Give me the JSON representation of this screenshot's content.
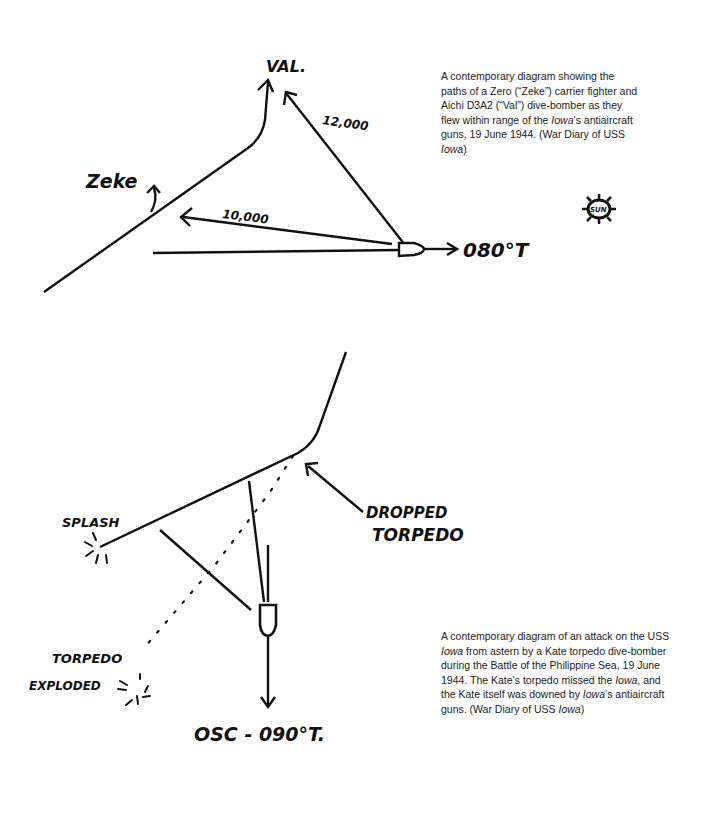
{
  "figure1": {
    "labels": {
      "val": "VAL.",
      "zeke": "Zeke",
      "range_val": "12,000",
      "range_zeke": "10,000",
      "heading": "080°T",
      "sun": "SUN"
    },
    "caption": {
      "p1": "A contemporary diagram showing the paths of a Zero (“Zeke”) carrier fighter and Aichi D3A2 (“Val”) dive-bomber as they flew within range of the ",
      "ship1": "Iowa",
      "p2": "’s antiaircraft guns, 19 June 1944. (War Diary of USS ",
      "ship2": "Iowa",
      "p3": ")"
    }
  },
  "figure2": {
    "labels": {
      "splash": "SPLASH",
      "dropped": "DROPPED",
      "torpedo": "TORPEDO",
      "torpedo_exploded_1": "TORPEDO",
      "torpedo_exploded_2": "EXPLODED",
      "heading": "OSC - 090°T."
    },
    "caption": {
      "p1": "A contemporary diagram of an attack on the USS ",
      "ship1": "Iowa",
      "p2": " from astern by a Kate torpedo dive-bomber during the Battle of the Philippine Sea, 19 June 1944. The Kate’s torpedo missed the ",
      "ship2": "Iowa",
      "p3": ", and the Kate itself was downed by ",
      "ship3": "Iowa",
      "p4": "’s antiaircraft guns. (War Diary of USS ",
      "ship4": "Iowa",
      "p5": ")"
    }
  }
}
